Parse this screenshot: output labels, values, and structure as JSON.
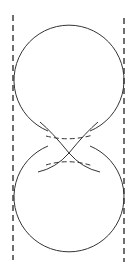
{
  "figure": {
    "width": 140,
    "height": 276,
    "stroke_color": "#333333",
    "dash_color": "#222222",
    "guides": [
      {
        "x": 13,
        "y1": 15,
        "y2": 260
      },
      {
        "x": 124,
        "y1": 18,
        "y2": 262
      }
    ],
    "circles": [
      {
        "cx": 69,
        "cy": 80,
        "r": 55
      },
      {
        "cx": 69,
        "cy": 197,
        "r": 55
      }
    ],
    "crossing_point": {
      "x": 69,
      "y": 153
    }
  }
}
